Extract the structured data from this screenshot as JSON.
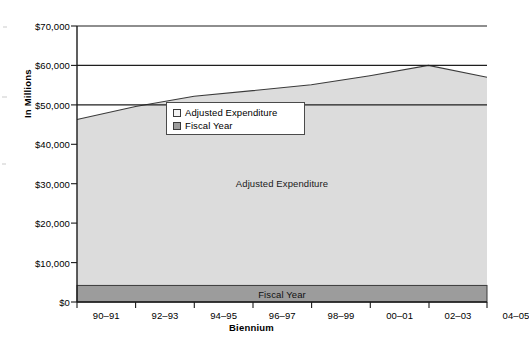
{
  "chart_data": {
    "type": "area",
    "title": "",
    "subtitle": "",
    "xlabel": "Biennium",
    "ylabel": "In Millions",
    "categories": [
      "90–91",
      "92–93",
      "94–95",
      "96–97",
      "98–99",
      "00–01",
      "02–03",
      "04–05"
    ],
    "xtick_labels": [
      "90–91",
      "92–93",
      "94–95",
      "96–97",
      "98–99",
      "00–01",
      "02–03",
      "04–05"
    ],
    "ytick_labels": [
      "$0",
      "$10,000",
      "$20,000",
      "$30,000",
      "$40,000",
      "$50,000",
      "$60,000",
      "$70,000"
    ],
    "ytick_values": [
      0,
      10000,
      20000,
      30000,
      40000,
      50000,
      60000,
      70000
    ],
    "ylim": [
      0,
      70000
    ],
    "ytick_step": 10000,
    "grid": "horizontal-major",
    "gridlines_drawn_at": [
      50000,
      60000,
      70000
    ],
    "legend_position": "inside-upper-left",
    "series": [
      {
        "name": "Adjusted Expenditure",
        "type": "area",
        "color": "#dcdcdc",
        "edge_color": "#3b3b3b",
        "values": [
          46300,
          49600,
          52200,
          53600,
          55100,
          57400,
          60000,
          57000
        ],
        "inner_label": "Adjusted Expenditure"
      },
      {
        "name": "Fiscal Year",
        "type": "area-band",
        "color": "#9c9c9c",
        "edge_color": "#3b3b3b",
        "values": [
          4200,
          4200,
          4200,
          4200,
          4200,
          4200,
          4200,
          4200
        ],
        "inner_label": "Fiscal Year"
      }
    ],
    "legend_entries": [
      {
        "label": "Adjusted Expenditure",
        "swatch_color": "#f2f2f2"
      },
      {
        "label": "Fiscal Year",
        "swatch_color": "#9c9c9c"
      }
    ],
    "colors": {
      "adjusted_expenditure_fill": "#dcdcdc",
      "fiscal_year_fill": "#9c9c9c",
      "axis": "#1a1a1a",
      "gridline": "#2b2b2b",
      "background": "#ffffff"
    },
    "axes_geometry": {
      "plot_left_px": 77,
      "plot_right_px": 487,
      "plot_top_px": 26,
      "plot_bottom_px": 302
    }
  }
}
